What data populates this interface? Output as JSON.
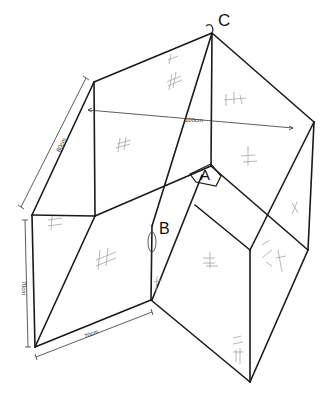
{
  "diagram": {
    "type": "hand-drawn isometric sketch of an L-shaped folded box / corner structure",
    "labels": {
      "C": "C",
      "A": "A",
      "B": "B"
    },
    "dimensions": {
      "top_span": "100cm",
      "left_slant": "80cm",
      "left_height": "70cm",
      "bottom_width": "70cm"
    },
    "colors": {
      "line": "#1a1a1a",
      "hatch": "#9a9a9a",
      "background": "#ffffff"
    }
  }
}
